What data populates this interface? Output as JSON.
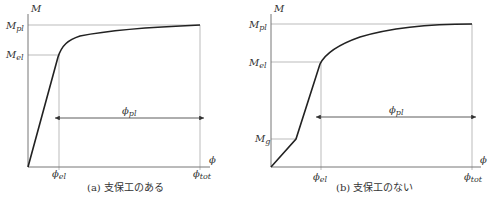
{
  "panels": [
    {
      "id": "a",
      "caption": "(a) 支保工のある",
      "y_axis_label": "M",
      "x_axis_label": "ϕ",
      "y_ticks": [
        {
          "main": "M",
          "sub": "pl"
        },
        {
          "main": "M",
          "sub": "el"
        }
      ],
      "x_ticks": [
        {
          "main": "ϕ",
          "sub": "el"
        },
        {
          "main": "ϕ",
          "sub": "tot"
        }
      ],
      "dimension": {
        "main": "ϕ",
        "sub": "pl"
      }
    },
    {
      "id": "b",
      "caption": "(b) 支保工のない",
      "y_axis_label": "M",
      "x_axis_label": "ϕ",
      "y_ticks": [
        {
          "main": "M",
          "sub": "pl"
        },
        {
          "main": "M",
          "sub": "el"
        },
        {
          "main": "M",
          "sub": "g"
        }
      ],
      "x_ticks": [
        {
          "main": "ϕ",
          "sub": "el"
        },
        {
          "main": "ϕ",
          "sub": "tot"
        }
      ],
      "dimension": {
        "main": "ϕ",
        "sub": "pl"
      }
    }
  ],
  "colors": {
    "curve": "#222222",
    "axis": "#888888",
    "guide": "#aaaaaa",
    "text": "#333333"
  }
}
